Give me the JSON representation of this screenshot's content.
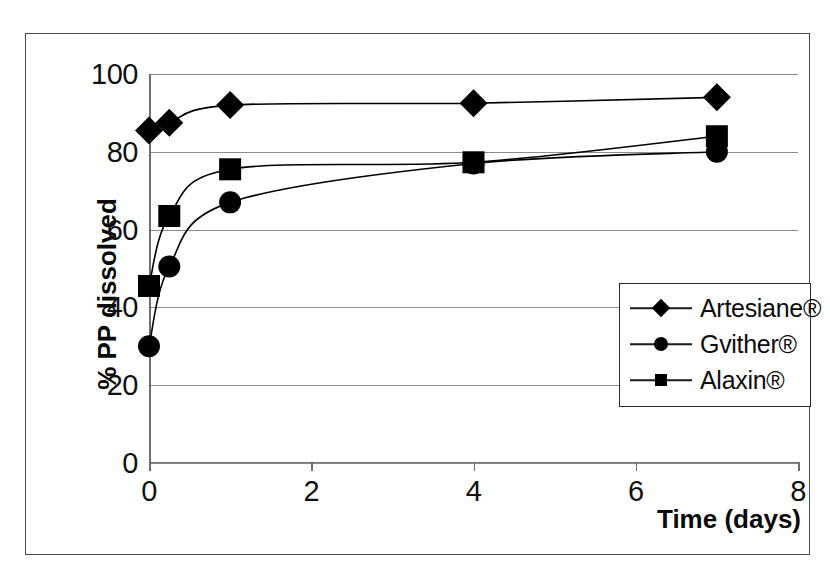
{
  "chart_data": {
    "type": "line",
    "title": "",
    "xlabel": "Time (days)",
    "ylabel": "% PP dissolved",
    "xlim": [
      0,
      8
    ],
    "ylim": [
      0,
      100
    ],
    "xticks": [
      "0",
      "2",
      "4",
      "6",
      "8"
    ],
    "xtick_values": [
      0,
      2,
      4,
      6,
      8
    ],
    "yticks": [
      "0",
      "20",
      "40",
      "60",
      "80",
      "100"
    ],
    "ytick_values": [
      0,
      20,
      40,
      60,
      80,
      100
    ],
    "grid": "horizontal",
    "legend_position": "center-right-inside",
    "x": [
      0,
      0.25,
      1,
      4,
      7
    ],
    "series": [
      {
        "name": "Artesiane®",
        "marker": "diamond",
        "values": [
          85.5,
          87.5,
          92.0,
          92.5,
          94.0
        ]
      },
      {
        "name": "Gvither®",
        "marker": "circle",
        "values": [
          30.0,
          50.5,
          67.0,
          77.0,
          80.0
        ]
      },
      {
        "name": "Alaxin®",
        "marker": "square",
        "values": [
          45.5,
          63.5,
          75.5,
          77.3,
          84.0
        ]
      }
    ]
  },
  "legend": {
    "items": [
      {
        "label": "Artesiane®",
        "marker": "diamond"
      },
      {
        "label": "Gvither®",
        "marker": "circle"
      },
      {
        "label": "Alaxin®",
        "marker": "square"
      }
    ]
  },
  "colors": {
    "series": "#000000",
    "gridline": "#8c8c8c",
    "axis": "#6e6e6e",
    "frame": "#4a4a4a",
    "text": "#111111",
    "background": "#ffffff"
  }
}
